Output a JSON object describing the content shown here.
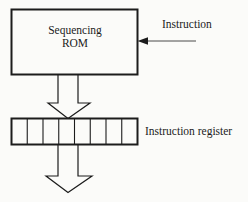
{
  "diagram": {
    "background_color": "#fbfbf9",
    "line_color": "#1c1c1c",
    "blocks": {
      "rom": {
        "label_line1": "Sequencing",
        "label_line2": "ROM",
        "x": 11,
        "y": 9,
        "width": 127,
        "height": 66
      },
      "instruction_register": {
        "label": "Instruction register",
        "x": 11,
        "y": 118,
        "width": 127,
        "height": 27,
        "cells": 8
      }
    },
    "arrows": {
      "instruction_input": {
        "label": "Instruction",
        "direction": "left",
        "from_x": 196,
        "to_x": 138,
        "y": 41
      },
      "rom_to_register": {
        "direction": "down",
        "from_y": 75,
        "to_y": 118,
        "shaft_left": 58,
        "shaft_right": 78,
        "head_left": 48,
        "head_right": 90
      },
      "register_output": {
        "direction": "down",
        "from_y": 145,
        "to_y": 192,
        "shaft_left": 58,
        "shaft_right": 78,
        "head_left": 48,
        "head_right": 90
      }
    }
  }
}
